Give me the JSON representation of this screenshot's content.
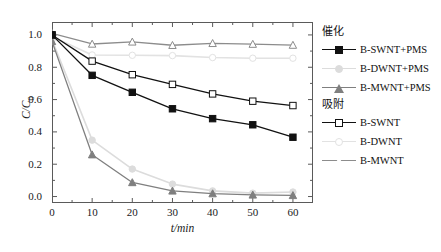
{
  "chart_data": {
    "type": "line",
    "title": "",
    "xlabel": "t/min",
    "ylabel": "C/C0",
    "ylabel_display": "C/C",
    "ylabel_sub": "0",
    "xlim": [
      0,
      65
    ],
    "ylim": [
      -0.04,
      1.08
    ],
    "grid": false,
    "legend_position": "right",
    "x": [
      0,
      10,
      20,
      30,
      40,
      50,
      60
    ],
    "xticks": [
      0,
      10,
      20,
      30,
      40,
      50,
      60
    ],
    "yticks": [
      0.0,
      0.2,
      0.4,
      0.6,
      0.8,
      1.0
    ],
    "ytick_labels": [
      "0.0",
      "0.2",
      "0.4",
      "0.6",
      "0.8",
      "1.0"
    ],
    "xtick_labels": [
      "0",
      "10",
      "20",
      "30",
      "40",
      "50",
      "60"
    ],
    "series": [
      {
        "name": "B-SWNT+PMS",
        "group": "催化",
        "marker": "square-filled",
        "color": "#111111",
        "values": [
          1.0,
          0.75,
          0.645,
          0.543,
          0.482,
          0.444,
          0.367
        ]
      },
      {
        "name": "B-DWNT+PMS",
        "group": "催化",
        "marker": "circle-filled",
        "color": "#dcdcdc",
        "values": [
          0.97,
          0.349,
          0.17,
          0.077,
          0.035,
          0.021,
          0.028
        ]
      },
      {
        "name": "B-MWNT+PMS",
        "group": "催化",
        "marker": "triangle-filled",
        "color": "#7f7f7f",
        "values": [
          0.96,
          0.259,
          0.087,
          0.035,
          0.018,
          0.01,
          0.007
        ]
      },
      {
        "name": "B-SWNT",
        "group": "吸附",
        "marker": "square-open",
        "color": "#111111",
        "values": [
          1.0,
          0.838,
          0.754,
          0.694,
          0.635,
          0.59,
          0.563
        ]
      },
      {
        "name": "B-DWNT",
        "group": "吸附",
        "marker": "circle-open",
        "color": "#e2e2e2",
        "values": [
          0.99,
          0.876,
          0.874,
          0.872,
          0.86,
          0.856,
          0.856
        ]
      },
      {
        "name": "B-MWNT",
        "group": "吸附",
        "marker": "triangle-open",
        "color": "#8c8c8c",
        "values": [
          1.01,
          0.944,
          0.957,
          0.936,
          0.948,
          0.943,
          0.937
        ]
      }
    ]
  },
  "legend": {
    "groups": [
      {
        "header": "催化",
        "items": [
          {
            "label": "B-SWNT+PMS",
            "marker": "square-filled",
            "color": "#111111"
          },
          {
            "label": "B-DWNT+PMS",
            "marker": "circle-filled",
            "color": "#dcdcdc"
          },
          {
            "label": "B-MWNT+PMS",
            "marker": "triangle-filled",
            "color": "#7f7f7f"
          }
        ]
      },
      {
        "header": "吸附",
        "items": [
          {
            "label": "B-SWNT",
            "marker": "square-open",
            "color": "#111111"
          },
          {
            "label": "B-DWNT",
            "marker": "circle-open",
            "color": "#e2e2e2"
          },
          {
            "label": "B-MWNT",
            "marker": "triangle-open",
            "color": "#8c8c8c"
          }
        ]
      }
    ]
  },
  "axes": {
    "x_title": "t/min",
    "y_title_main": "C/C",
    "y_title_sub": "0"
  },
  "caption": ""
}
